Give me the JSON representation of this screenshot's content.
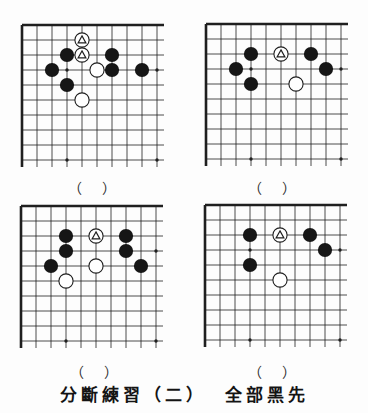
{
  "caption": {
    "title": "分斷練習（二）",
    "instruction": "全部黑先"
  },
  "board_config": {
    "grid_lines": 10,
    "corner": "top-left",
    "star_points": [
      [
        4,
        4
      ],
      [
        10,
        4
      ],
      [
        4,
        10
      ],
      [
        10,
        10
      ]
    ],
    "colors": {
      "line": "#1f1f1f",
      "black_stone": "#161616",
      "white_stone": "#ffffff",
      "paper": "#fdfdfd"
    }
  },
  "problems": [
    {
      "name": "problem-1",
      "answer_label": "（　）",
      "black_stones": [
        [
          4,
          3
        ],
        [
          7,
          3
        ],
        [
          3,
          4
        ],
        [
          7,
          4
        ],
        [
          9,
          4
        ],
        [
          4,
          5
        ]
      ],
      "white_stones": [
        [
          5,
          2
        ],
        [
          5,
          3
        ],
        [
          6,
          4
        ],
        [
          5,
          6
        ]
      ],
      "triangle_marked": [
        [
          5,
          2
        ],
        [
          5,
          3
        ]
      ]
    },
    {
      "name": "problem-2",
      "answer_label": "（　）",
      "black_stones": [
        [
          4,
          3
        ],
        [
          8,
          3
        ],
        [
          3,
          4
        ],
        [
          9,
          4
        ],
        [
          4,
          5
        ]
      ],
      "white_stones": [
        [
          6,
          3
        ],
        [
          7,
          5
        ]
      ],
      "triangle_marked": [
        [
          6,
          3
        ]
      ]
    },
    {
      "name": "problem-3",
      "answer_label": "（　）",
      "black_stones": [
        [
          4,
          3
        ],
        [
          8,
          3
        ],
        [
          4,
          4
        ],
        [
          8,
          4
        ],
        [
          3,
          5
        ],
        [
          9,
          5
        ]
      ],
      "white_stones": [
        [
          6,
          3
        ],
        [
          6,
          5
        ],
        [
          4,
          6
        ]
      ],
      "triangle_marked": [
        [
          6,
          3
        ]
      ]
    },
    {
      "name": "problem-4",
      "answer_label": "（　）",
      "black_stones": [
        [
          4,
          3
        ],
        [
          8,
          3
        ],
        [
          9,
          4
        ],
        [
          4,
          5
        ]
      ],
      "white_stones": [
        [
          6,
          3
        ],
        [
          6,
          6
        ]
      ],
      "triangle_marked": [
        [
          6,
          3
        ]
      ]
    }
  ]
}
